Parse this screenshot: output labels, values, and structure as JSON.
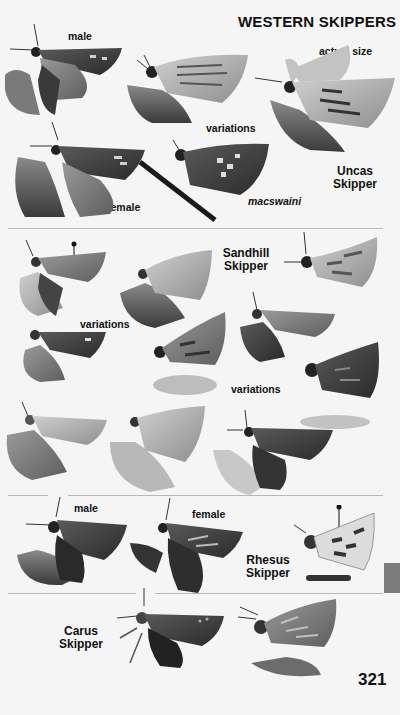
{
  "page": {
    "section_title": "WESTERN SKIPPERS",
    "page_number": "321",
    "thumb_tab_color": "#7b7b7b",
    "background_color": "#f5f5f5"
  },
  "plates": [
    {
      "species": "Uncas Skipper",
      "species_lines": [
        "Uncas",
        "Skipper"
      ],
      "labels": {
        "male": "male",
        "female": "female",
        "actual_size": "actual size",
        "variations": "variations",
        "subspecies": "macswaini"
      },
      "specimens": [
        "male",
        "variation-1",
        "variation-2",
        "female",
        "macswaini"
      ]
    },
    {
      "species": "Sandhill Skipper",
      "species_lines": [
        "Sandhill",
        "Skipper"
      ],
      "labels": {
        "variations_1": "variations",
        "variations_2": "variations"
      },
      "specimens": [
        "specimen-1",
        "specimen-2",
        "specimen-3",
        "specimen-4",
        "specimen-5",
        "specimen-6",
        "specimen-7",
        "specimen-8",
        "specimen-9",
        "specimen-10"
      ]
    },
    {
      "species": "Rhesus Skipper",
      "species_lines": [
        "Rhesus",
        "Skipper"
      ],
      "labels": {
        "male": "male",
        "female": "female"
      },
      "specimens": [
        "male",
        "female",
        "underside"
      ]
    },
    {
      "species": "Carus Skipper",
      "species_lines": [
        "Carus",
        "Skipper"
      ],
      "labels": {},
      "specimens": [
        "upperside",
        "underside"
      ]
    }
  ]
}
